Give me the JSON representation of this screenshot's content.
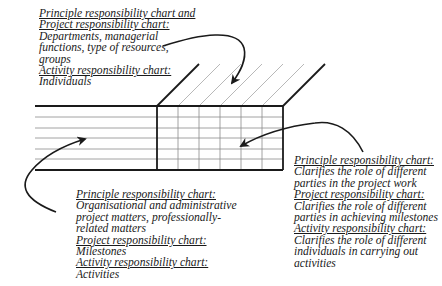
{
  "figure": {
    "type": "three-dimensional responsibility chart diagram",
    "colors": {
      "line": "#1a1a1a",
      "thin_line": "#8a8a8a",
      "background": "#ffffff"
    }
  },
  "annotations": {
    "top": {
      "lines": [
        {
          "text": "Principle responsibility chart and",
          "heading": true
        },
        {
          "text": "Project responsibility chart:",
          "heading": true
        },
        {
          "text": "Departments, managerial",
          "heading": false
        },
        {
          "text": "functions, type of resources,",
          "heading": false
        },
        {
          "text": "groups",
          "heading": false
        },
        {
          "text": "Activity responsibility chart:",
          "heading": true
        },
        {
          "text": "Individuals",
          "heading": false
        }
      ]
    },
    "bottom_left": {
      "lines": [
        {
          "text": "Principle responsibility chart:",
          "heading": true
        },
        {
          "text": "Organisational and administrative",
          "heading": false
        },
        {
          "text": "project matters, professionally-",
          "heading": false
        },
        {
          "text": "related matters",
          "heading": false
        },
        {
          "text": "Project responsibility chart:",
          "heading": true
        },
        {
          "text": "Milestones",
          "heading": false
        },
        {
          "text": "Activity responsibility chart:",
          "heading": true
        },
        {
          "text": "Activities",
          "heading": false
        }
      ]
    },
    "bottom_right": {
      "lines": [
        {
          "text": "Principle responsibility chart:",
          "heading": true
        },
        {
          "text": "Clarifies the role of different",
          "heading": false
        },
        {
          "text": "parties in the project work",
          "heading": false
        },
        {
          "text": "Project responsibility chart:",
          "heading": true
        },
        {
          "text": "Clarifies the role of different",
          "heading": false
        },
        {
          "text": "parties in achieving milestones",
          "heading": false
        },
        {
          "text": "Activity responsibility chart:",
          "heading": true
        },
        {
          "text": "Clarifies the role of different",
          "heading": false
        },
        {
          "text": "individuals in carrying out",
          "heading": false
        },
        {
          "text": "activities",
          "heading": false
        }
      ]
    }
  }
}
